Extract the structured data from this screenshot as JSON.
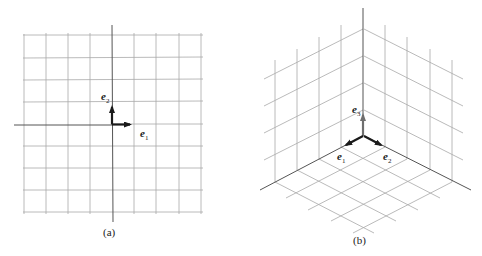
{
  "figure": {
    "panels": [
      {
        "id": "a",
        "caption": "(a)",
        "description": "2D Cartesian grid with standard basis vectors",
        "vectors": [
          {
            "name": "e",
            "subscript": "1",
            "direction": "right"
          },
          {
            "name": "e",
            "subscript": "2",
            "direction": "up"
          }
        ]
      },
      {
        "id": "b",
        "caption": "(b)",
        "description": "3D isometric grid (floor and two walls) with standard basis vectors",
        "vectors": [
          {
            "name": "e",
            "subscript": "1",
            "direction": "left-down"
          },
          {
            "name": "e",
            "subscript": "2",
            "direction": "right-down"
          },
          {
            "name": "e",
            "subscript": "3",
            "direction": "up"
          }
        ]
      }
    ]
  },
  "colors": {
    "grid": "#a8a8a8",
    "axis": "#555555",
    "vector_dark": "#1a1a1a",
    "vector_gray": "#6e6e6e"
  }
}
